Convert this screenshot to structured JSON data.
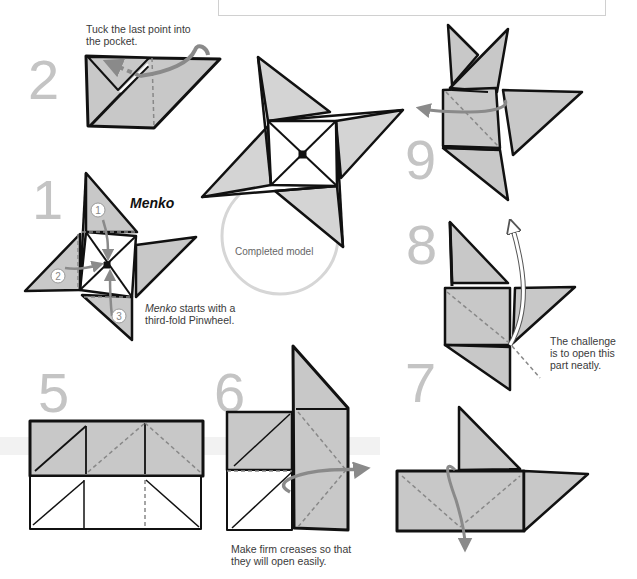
{
  "diagram": {
    "title": "Menko",
    "colors": {
      "paper_fill": "#c8c8c8",
      "outline": "#111111",
      "step_number": "#c4c4c4",
      "arrow": "#8a8a8a",
      "crease": "#8a8a8a",
      "caption_text": "#3a3a3a"
    },
    "steps": [
      {
        "number": "1",
        "caption_italic": "Menko",
        "caption_rest": " starts with a third-fold Pinwheel.",
        "callouts": [
          "1",
          "2",
          "3"
        ]
      },
      {
        "number": "2",
        "caption": "Tuck the last point into the pocket."
      },
      {
        "number": "5"
      },
      {
        "number": "6",
        "caption": "Make firm creases so that they will open easily."
      },
      {
        "number": "7"
      },
      {
        "number": "8",
        "caption": "The challenge is to open this part neatly."
      },
      {
        "number": "9"
      }
    ],
    "completed_label": "Completed model",
    "captions": {
      "step2_line1": "Tuck the last point into",
      "step2_line2": "the pocket.",
      "step1_italic": "Menko",
      "step1_line1_rest": " starts with a",
      "step1_line2": "third-fold Pinwheel.",
      "step6_line1": "Make firm creases so that",
      "step6_line2": "they will open easily.",
      "step8_line1": "The challenge",
      "step8_line2": "is to open this",
      "step8_line3": "part neatly."
    }
  }
}
